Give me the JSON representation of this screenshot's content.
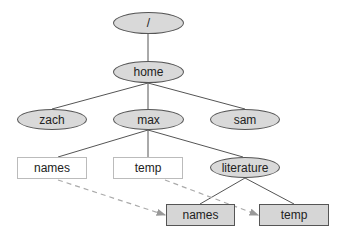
{
  "diagram": {
    "type": "directory-tree",
    "nodes": {
      "root": {
        "label": "/",
        "shape": "ellipse"
      },
      "home": {
        "label": "home",
        "shape": "ellipse"
      },
      "zach": {
        "label": "zach",
        "shape": "ellipse"
      },
      "max": {
        "label": "max",
        "shape": "ellipse"
      },
      "sam": {
        "label": "sam",
        "shape": "ellipse"
      },
      "max_names": {
        "label": "names",
        "shape": "box-light"
      },
      "max_temp": {
        "label": "temp",
        "shape": "box-light"
      },
      "literature": {
        "label": "literature",
        "shape": "ellipse"
      },
      "lit_names": {
        "label": "names",
        "shape": "box-dark"
      },
      "lit_temp": {
        "label": "temp",
        "shape": "box-dark"
      }
    },
    "edges": [
      [
        "root",
        "home"
      ],
      [
        "home",
        "zach"
      ],
      [
        "home",
        "max"
      ],
      [
        "home",
        "sam"
      ],
      [
        "max",
        "max_names"
      ],
      [
        "max",
        "max_temp"
      ],
      [
        "max",
        "literature"
      ],
      [
        "literature",
        "lit_names"
      ],
      [
        "literature",
        "lit_temp"
      ]
    ],
    "links": [
      {
        "from": "max_names",
        "to": "lit_names",
        "style": "dashed"
      },
      {
        "from": "max_temp",
        "to": "lit_temp",
        "style": "dashed"
      }
    ],
    "colors": {
      "ellipse_fill": "#d9d9d9",
      "box_dark_fill": "#d6d6d6",
      "edge": "#555555",
      "dashed_link": "#aaaaaa"
    }
  }
}
